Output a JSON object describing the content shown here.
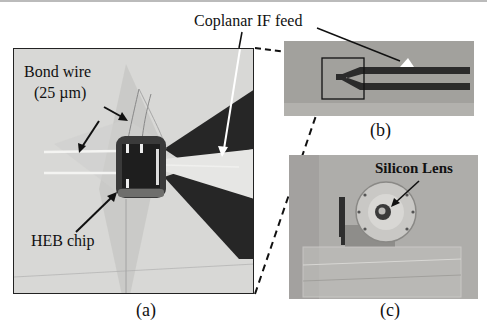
{
  "figure": {
    "panels": [
      {
        "id": "a",
        "caption": "(a)",
        "description": "HEB chip with bond wires mounted at coplanar IF feed"
      },
      {
        "id": "b",
        "caption": "(b)",
        "description": "Coplanar IF feed board with highlighted chip region"
      },
      {
        "id": "c",
        "caption": "(c)",
        "description": "Mixer block with silicon lens"
      }
    ],
    "annotations": {
      "coplanar_if_feed": "Coplanar IF feed",
      "bond_wire_line1": "Bond wire",
      "bond_wire_line2": "(25 µm)",
      "heb_chip": "HEB chip",
      "silicon_lens": "Silicon Lens"
    },
    "colors": {
      "panel_a_bg": "#d6d6d4",
      "panel_b_bg": "#9e9d99",
      "panel_c_bg": "#b0afac",
      "trace_dark": "#2a2a2a",
      "arrow": "#111111",
      "arrow_light": "#ffffff"
    }
  }
}
